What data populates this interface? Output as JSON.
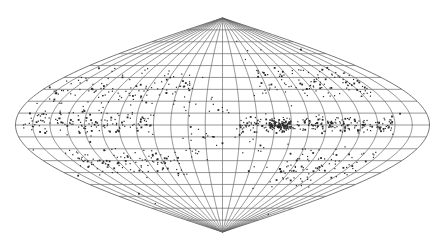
{
  "chart_data": {
    "type": "scatter",
    "projection": "sinusoidal",
    "title": "",
    "xlabel": "",
    "ylabel": "",
    "legend": [],
    "grid": true,
    "graticule": {
      "meridian_step_deg": 15,
      "parallel_step_deg": 10,
      "lon_range": [
        -180,
        180
      ],
      "lat_range": [
        -90,
        90
      ]
    },
    "layout_px": {
      "center_x": 222.5,
      "center_y": 125,
      "half_width": 207,
      "half_height": 107
    },
    "colors": {
      "background": "#ffffff",
      "grid": "#6a6a6a",
      "points": "#2a2a2a"
    },
    "clusters": [
      {
        "name": "equatorial-band-east",
        "lon": [
          15,
          150
        ],
        "lat": [
          -8,
          8
        ],
        "count": 260
      },
      {
        "name": "dense-knot-east",
        "lon": [
          40,
          60
        ],
        "lat": [
          -4,
          4
        ],
        "count": 80
      },
      {
        "name": "band-west",
        "lon": [
          -175,
          -60
        ],
        "lat": [
          -10,
          14
        ],
        "count": 150
      },
      {
        "name": "southwest-arc",
        "lon": [
          -150,
          -40
        ],
        "lat": [
          -45,
          -18
        ],
        "count": 110
      },
      {
        "name": "northeast-arc",
        "lon": [
          40,
          150
        ],
        "lat": [
          18,
          50
        ],
        "count": 110
      },
      {
        "name": "southeast-arc",
        "lon": [
          60,
          150
        ],
        "lat": [
          -55,
          -15
        ],
        "count": 90
      },
      {
        "name": "northwest-scatter",
        "lon": [
          -170,
          -30
        ],
        "lat": [
          10,
          50
        ],
        "count": 120
      },
      {
        "name": "central-scatter",
        "lon": [
          -40,
          40
        ],
        "lat": [
          -40,
          40
        ],
        "count": 50
      },
      {
        "name": "polar-sparse",
        "lon": [
          -180,
          180
        ],
        "lat": [
          -80,
          80
        ],
        "count": 40
      }
    ]
  }
}
